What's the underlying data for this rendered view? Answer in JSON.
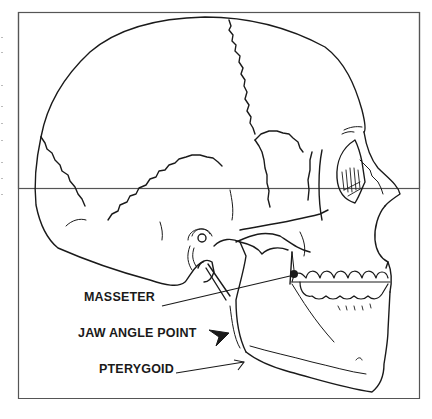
{
  "figure": {
    "type": "anatomical line drawing",
    "labels": [
      {
        "id": "masseter",
        "text": "MASSETER"
      },
      {
        "id": "jaw_angle_point",
        "text": "JAW ANGLE POINT"
      },
      {
        "id": "pterygoid",
        "text": "PTERYGOID"
      }
    ],
    "colors": {
      "line": "#1a1a1a",
      "frame": "#555555",
      "background": "#ffffff"
    }
  }
}
